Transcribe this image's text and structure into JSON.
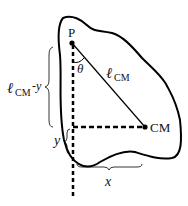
{
  "diagram": {
    "points": {
      "pivot": {
        "label": "P",
        "x": 72,
        "y": 43
      },
      "center_of_mass": {
        "label": "CM",
        "x": 145,
        "y": 127
      }
    },
    "labels": {
      "angle": "θ",
      "length_symbol": "ℓ",
      "length_subscript": "CM",
      "vertical_diff_symbol": "ℓ",
      "vertical_diff_subscript": "CM",
      "vertical_diff_suffix": "-y",
      "y": "y",
      "x": "x"
    },
    "colors": {
      "stroke": "#000000",
      "text": "#111111",
      "background": "#ffffff"
    }
  }
}
